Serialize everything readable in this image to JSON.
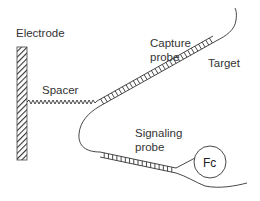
{
  "diagram": {
    "labels": {
      "electrode": "Electrode",
      "spacer": "Spacer",
      "capture_probe_line1": "Capture",
      "capture_probe_line2": "probe",
      "target": "Target",
      "signaling_probe_line1": "Signaling",
      "signaling_probe_line2": "probe",
      "redox_tag": "Fc"
    },
    "components": [
      {
        "id": "electrode",
        "shape": "hatched-rectangle"
      },
      {
        "id": "spacer",
        "shape": "zigzag-line"
      },
      {
        "id": "capture-probe",
        "shape": "ladder"
      },
      {
        "id": "target",
        "shape": "curved-strand"
      },
      {
        "id": "signaling-probe",
        "shape": "ladder"
      },
      {
        "id": "redox-tag",
        "shape": "circle"
      }
    ],
    "colors": {
      "stroke": "#333333",
      "background": "#ffffff"
    }
  }
}
